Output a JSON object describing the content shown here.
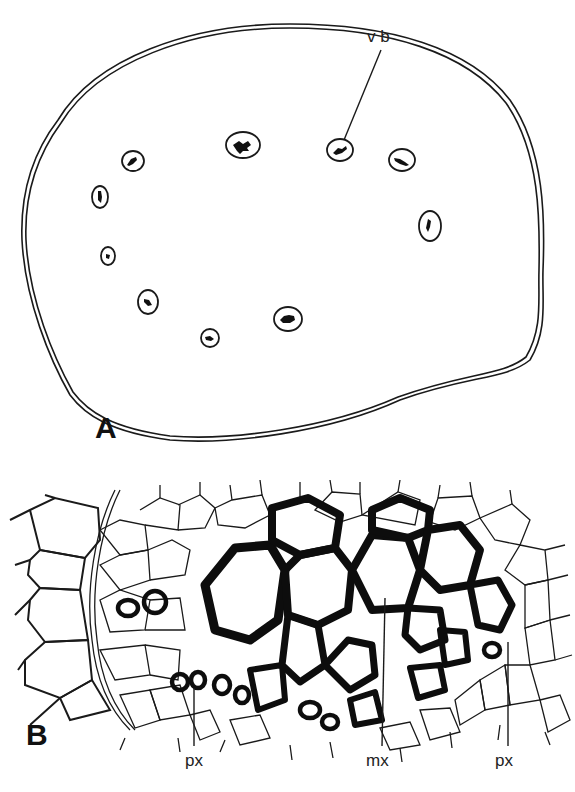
{
  "figure": {
    "panel_a": {
      "letter": "A",
      "description": "Transverse section outline with a ring of scattered vascular bundles",
      "labels": [
        {
          "text": "v b",
          "meaning": "vascular bundle"
        }
      ],
      "bundle_count": 11
    },
    "panel_b": {
      "letter": "B",
      "description": "Detail of a vascular bundle showing thick-walled xylem cells among thin-walled parenchyma",
      "labels": [
        {
          "text": "px",
          "meaning": "protoxylem"
        },
        {
          "text": "mx",
          "meaning": "metaxylem"
        },
        {
          "text": "px",
          "meaning": "protoxylem"
        }
      ]
    }
  }
}
